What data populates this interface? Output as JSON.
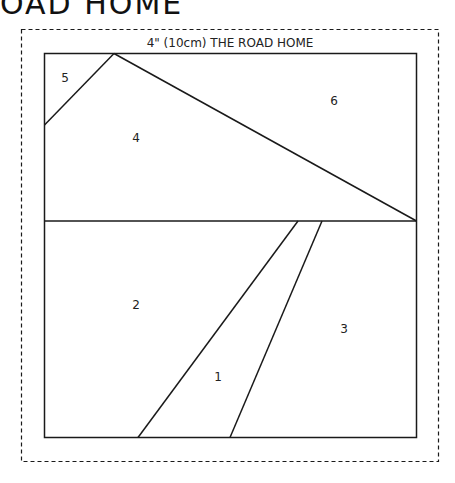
{
  "page_header_partial": "OAD HOME",
  "block": {
    "title": "4\" (10cm) THE ROAD HOME",
    "pieces": [
      {
        "id": "1",
        "label": "1"
      },
      {
        "id": "2",
        "label": "2"
      },
      {
        "id": "3",
        "label": "3"
      },
      {
        "id": "4",
        "label": "4"
      },
      {
        "id": "5",
        "label": "5"
      },
      {
        "id": "6",
        "label": "6"
      }
    ]
  },
  "colors": {
    "line": "#1a1a1a",
    "background": "#ffffff"
  }
}
